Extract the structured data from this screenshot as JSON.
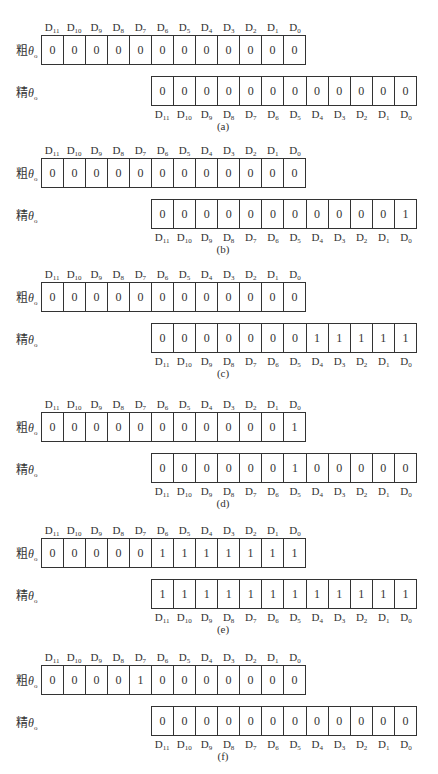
{
  "labels": {
    "coarse_prefix": "粗",
    "fine_prefix": "精",
    "theta": "θ",
    "theta_sub": "o"
  },
  "bit_names": [
    "D11",
    "D10",
    "D9",
    "D8",
    "D7",
    "D6",
    "D5",
    "D4",
    "D3",
    "D2",
    "D1",
    "D0"
  ],
  "panels": [
    {
      "caption": "(a)",
      "top": 19,
      "coarse": [
        "0",
        "0",
        "0",
        "0",
        "0",
        "0",
        "0",
        "0",
        "0",
        "0",
        "0",
        "0"
      ],
      "fine": [
        "0",
        "0",
        "0",
        "0",
        "0",
        "0",
        "0",
        "0",
        "0",
        "0",
        "0",
        "0"
      ]
    },
    {
      "caption": "(b)",
      "top": 142,
      "coarse": [
        "0",
        "0",
        "0",
        "0",
        "0",
        "0",
        "0",
        "0",
        "0",
        "0",
        "0",
        "0"
      ],
      "fine": [
        "0",
        "0",
        "0",
        "0",
        "0",
        "0",
        "0",
        "0",
        "0",
        "0",
        "0",
        "1"
      ]
    },
    {
      "caption": "(c)",
      "top": 266,
      "coarse": [
        "0",
        "0",
        "0",
        "0",
        "0",
        "0",
        "0",
        "0",
        "0",
        "0",
        "0",
        "0"
      ],
      "fine": [
        "0",
        "0",
        "0",
        "0",
        "0",
        "0",
        "0",
        "1",
        "1",
        "1",
        "1",
        "1"
      ]
    },
    {
      "caption": "(d)",
      "top": 396,
      "coarse": [
        "0",
        "0",
        "0",
        "0",
        "0",
        "0",
        "0",
        "0",
        "0",
        "0",
        "0",
        "1"
      ],
      "fine": [
        "0",
        "0",
        "0",
        "0",
        "0",
        "0",
        "1",
        "0",
        "0",
        "0",
        "0",
        "0"
      ]
    },
    {
      "caption": "(e)",
      "top": 522,
      "coarse": [
        "0",
        "0",
        "0",
        "0",
        "0",
        "1",
        "1",
        "1",
        "1",
        "1",
        "1",
        "1"
      ],
      "fine": [
        "1",
        "1",
        "1",
        "1",
        "1",
        "1",
        "1",
        "1",
        "1",
        "1",
        "1",
        "1"
      ]
    },
    {
      "caption": "(f)",
      "top": 649,
      "coarse": [
        "0",
        "0",
        "0",
        "0",
        "1",
        "0",
        "0",
        "0",
        "0",
        "0",
        "0",
        "0"
      ],
      "fine": [
        "0",
        "0",
        "0",
        "0",
        "0",
        "0",
        "0",
        "0",
        "0",
        "0",
        "0",
        "0"
      ]
    }
  ]
}
